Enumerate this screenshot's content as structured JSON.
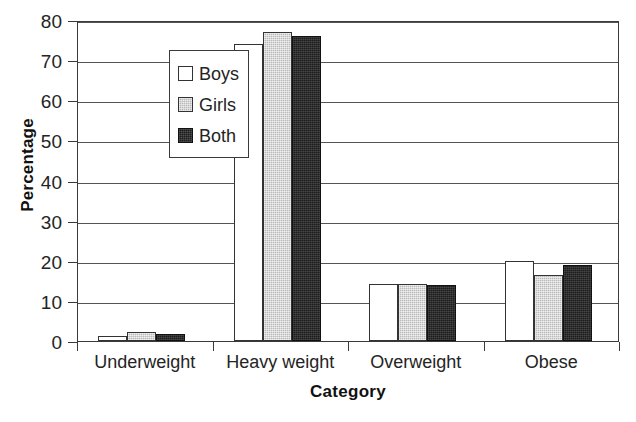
{
  "chart_data": {
    "type": "bar",
    "title": "",
    "xlabel": "Category",
    "ylabel": "Percentage",
    "categories": [
      "Underweight",
      "Heavy weight",
      "Overweight",
      "Obese"
    ],
    "series": [
      {
        "name": "Boys",
        "color": "#ffffff",
        "values": [
          1.3,
          74.0,
          14.2,
          20.0
        ]
      },
      {
        "name": "Girls",
        "color": "#b9b9b9",
        "values": [
          2.2,
          77.0,
          14.1,
          16.5
        ]
      },
      {
        "name": "Both",
        "color": "#1d1d1d",
        "values": [
          1.7,
          76.0,
          14.0,
          19.0
        ]
      }
    ],
    "ylim": [
      0,
      80
    ],
    "yticks": [
      0,
      10,
      20,
      30,
      40,
      50,
      60,
      70,
      80
    ],
    "ytick_labels": [
      "0",
      "10",
      "20",
      "30",
      "40",
      "50",
      "60",
      "70",
      "80"
    ],
    "grid": true,
    "grid_axis": "y",
    "legend_position": "upper-left-inside"
  },
  "legend": {
    "entries": [
      {
        "label": "Boys",
        "swatch": "white-square-icon"
      },
      {
        "label": "Girls",
        "swatch": "gray-square-icon"
      },
      {
        "label": "Both",
        "swatch": "black-square-icon"
      }
    ]
  },
  "axes": {
    "y_title": "Percentage",
    "x_title": "Category"
  }
}
